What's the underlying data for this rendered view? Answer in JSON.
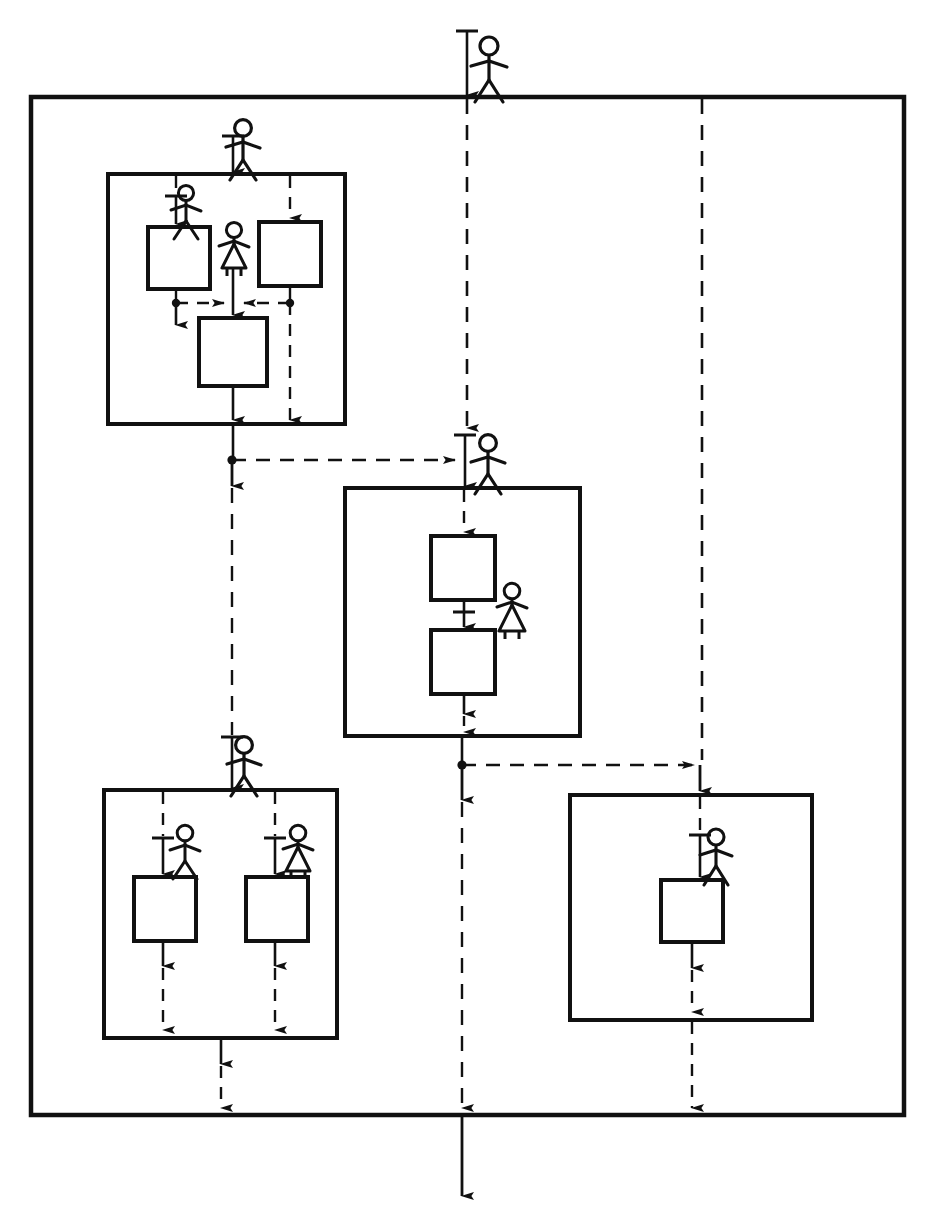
{
  "figure": {
    "style": {
      "stroke": "#111111",
      "background": "#ffffff",
      "solid_line_label": "solid control flow",
      "dashed_line_label": "dashed data flow"
    },
    "caption": ""
  },
  "outer_container": {
    "name": "outer-system-boundary",
    "x": 31,
    "y": 97,
    "width": 873,
    "height": 1018
  },
  "containers": [
    {
      "id": "top-left",
      "name": "process-group-top-left",
      "x": 108,
      "y": 174,
      "width": 237,
      "height": 250
    },
    {
      "id": "middle",
      "name": "process-group-middle",
      "x": 345,
      "y": 488,
      "width": 235,
      "height": 248
    },
    {
      "id": "bottom-left",
      "name": "process-group-bottom-left",
      "x": 104,
      "y": 790,
      "width": 233,
      "height": 248
    },
    {
      "id": "bottom-right",
      "name": "process-group-bottom-right",
      "x": 570,
      "y": 795,
      "width": 242,
      "height": 225
    }
  ],
  "process_boxes": [
    {
      "id": "p1",
      "name": "process-box-top-left-a",
      "x": 148,
      "y": 227,
      "width": 62,
      "height": 62,
      "label": ""
    },
    {
      "id": "p2",
      "name": "process-box-top-left-b",
      "x": 259,
      "y": 222,
      "width": 62,
      "height": 64,
      "label": ""
    },
    {
      "id": "p3",
      "name": "process-box-top-left-c",
      "x": 199,
      "y": 318,
      "width": 68,
      "height": 68,
      "label": ""
    },
    {
      "id": "p4",
      "name": "process-box-middle-a",
      "x": 431,
      "y": 536,
      "width": 64,
      "height": 64,
      "label": ""
    },
    {
      "id": "p5",
      "name": "process-box-middle-b",
      "x": 431,
      "y": 630,
      "width": 64,
      "height": 64,
      "label": ""
    },
    {
      "id": "p6",
      "name": "process-box-bottom-left-a",
      "x": 134,
      "y": 877,
      "width": 62,
      "height": 64,
      "label": ""
    },
    {
      "id": "p7",
      "name": "process-box-bottom-left-b",
      "x": 246,
      "y": 877,
      "width": 62,
      "height": 64,
      "label": ""
    },
    {
      "id": "p8",
      "name": "process-box-bottom-right",
      "x": 661,
      "y": 880,
      "width": 62,
      "height": 62,
      "label": ""
    }
  ],
  "actors": [
    {
      "id": "a0",
      "name": "actor-male-system-entry",
      "gender": "male",
      "x": 489,
      "y": 46,
      "label": ""
    },
    {
      "id": "a1",
      "name": "actor-male-top-left-group",
      "gender": "male",
      "x": 243,
      "y": 128,
      "label": ""
    },
    {
      "id": "a2",
      "name": "actor-male-top-left-process-a",
      "gender": "male",
      "x": 186,
      "y": 193,
      "label": ""
    },
    {
      "id": "a3",
      "name": "actor-female-top-left-merge",
      "gender": "female",
      "x": 234,
      "y": 230,
      "label": ""
    },
    {
      "id": "a4",
      "name": "actor-male-middle-group",
      "gender": "male",
      "x": 488,
      "y": 443,
      "label": ""
    },
    {
      "id": "a5",
      "name": "actor-female-middle-process",
      "gender": "female",
      "x": 512,
      "y": 591,
      "label": ""
    },
    {
      "id": "a6",
      "name": "actor-male-bottom-left-group",
      "gender": "male",
      "x": 244,
      "y": 745,
      "label": ""
    },
    {
      "id": "a7",
      "name": "actor-male-bottom-left-a",
      "gender": "male",
      "x": 185,
      "y": 833,
      "label": ""
    },
    {
      "id": "a8",
      "name": "actor-female-bottom-left-b",
      "gender": "female",
      "x": 298,
      "y": 833,
      "label": ""
    },
    {
      "id": "a9",
      "name": "actor-male-bottom-right",
      "gender": "male",
      "x": 716,
      "y": 837,
      "label": ""
    }
  ],
  "connectors": [
    {
      "id": "c1",
      "name": "flow-system-entry",
      "type": "solid",
      "orientation": "vertical"
    },
    {
      "id": "c2",
      "name": "flow-main-vertical-dashed",
      "type": "dashed",
      "orientation": "vertical"
    },
    {
      "id": "c3",
      "name": "flow-right-vertical-dashed",
      "type": "dashed",
      "orientation": "vertical"
    },
    {
      "id": "c4",
      "name": "flow-top-left-to-middle",
      "type": "dashed",
      "orientation": "horizontal"
    },
    {
      "id": "c5",
      "name": "flow-middle-to-bottom-right",
      "type": "dashed",
      "orientation": "horizontal"
    },
    {
      "id": "c6",
      "name": "flow-top-left-internal-merge",
      "type": "dashed",
      "orientation": "horizontal"
    },
    {
      "id": "c7",
      "name": "flow-left-branch-dashed",
      "type": "dashed",
      "orientation": "vertical"
    },
    {
      "id": "c8",
      "name": "flow-bottom-left-exit",
      "type": "dashed",
      "orientation": "vertical"
    },
    {
      "id": "c9",
      "name": "flow-bottom-right-exit",
      "type": "dashed",
      "orientation": "vertical"
    },
    {
      "id": "c10",
      "name": "flow-system-exit",
      "type": "solid",
      "orientation": "vertical"
    }
  ],
  "junctions": [
    {
      "id": "j1",
      "name": "junction-dot-top-left-west",
      "x": 176,
      "y": 303
    },
    {
      "id": "j2",
      "name": "junction-dot-top-left-center",
      "x": 233,
      "y": 303
    },
    {
      "id": "j3",
      "name": "junction-dot-top-left-east",
      "x": 290,
      "y": 303
    },
    {
      "id": "j4",
      "name": "junction-dot-mid-left",
      "x": 232,
      "y": 460
    },
    {
      "id": "j5",
      "name": "junction-dot-mid-center",
      "x": 462,
      "y": 765
    }
  ]
}
